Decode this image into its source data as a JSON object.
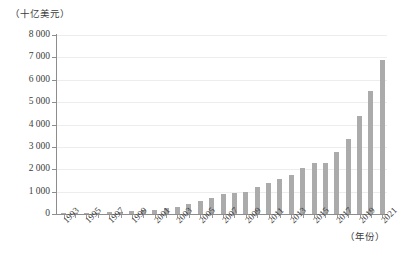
{
  "chart_data": {
    "type": "bar",
    "title": "",
    "subtitle": "",
    "xlabel": "（年份）",
    "ylabel": "（十亿美元）",
    "ylim": [
      0,
      8000
    ],
    "ytick_step": 1000,
    "yticks": [
      "8 000",
      "7 000",
      "6 000",
      "5 000",
      "4 000",
      "3 000",
      "2 000",
      "1 000",
      "0"
    ],
    "ytick_values": [
      8000,
      7000,
      6000,
      5000,
      4000,
      3000,
      2000,
      1000,
      0
    ],
    "grid": true,
    "legend": "none",
    "bar_color": "#ababab",
    "axis_color": "#8d8d8d",
    "categories": [
      "1993",
      "1994",
      "1995",
      "1996",
      "1997",
      "1998",
      "1999",
      "1400",
      "2001",
      "2002",
      "2003",
      "2004",
      "2005",
      "2006",
      "2007",
      "2008",
      "2009",
      "2010",
      "2011",
      "2012",
      "2013",
      "2014",
      "2015",
      "2016",
      "2017",
      "2018",
      "2019",
      "2020",
      "2021"
    ],
    "x_tick_labels": [
      "1993",
      "1995",
      "1997",
      "1999",
      "2001",
      "2003",
      "2005",
      "2007",
      "2009",
      "2011",
      "2013",
      "2015",
      "2017",
      "2019",
      "2021"
    ],
    "series": [
      {
        "name": "",
        "values": [
          20,
          30,
          45,
          60,
          80,
          100,
          130,
          170,
          200,
          250,
          330,
          430,
          560,
          700,
          880,
          950,
          1000,
          1200,
          1400,
          1550,
          1750,
          2050,
          2300,
          2300,
          2750,
          3350,
          4400,
          5500,
          6900
        ]
      }
    ],
    "years": [
      1993,
      1994,
      1995,
      1996,
      1997,
      1998,
      1999,
      2000,
      2001,
      2002,
      2003,
      2004,
      2005,
      2006,
      2007,
      2008,
      2009,
      2010,
      2011,
      2012,
      2013,
      2014,
      2015,
      2016,
      2017,
      2018,
      2019,
      2020,
      2021
    ]
  }
}
